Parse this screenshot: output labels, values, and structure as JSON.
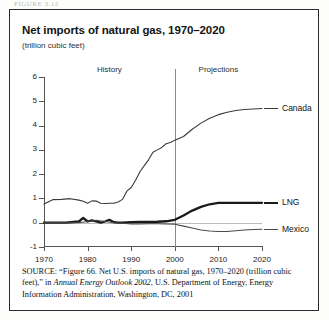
{
  "page": {
    "top_stub_text": "FIGURE 3.12"
  },
  "header": {
    "title": "Net imports of natural gas, 1970–2020",
    "subtitle": "(trillion cubic feet)"
  },
  "source": {
    "label": "SOURCE:",
    "part1": " “Figure 66. Net U.S. imports of natural gas, 1970–2020 (trillion cubic feet),” in ",
    "italic": "Annual Energy Outlook 2002",
    "part2": ", U.S. Department of Energy, Energy Information Administration, Washington, DC, 2001"
  },
  "chart_data": {
    "type": "line",
    "title": "Net imports of natural gas, 1970–2020",
    "subtitle": "(trillion cubic feet)",
    "xlabel": "",
    "ylabel": "(trillion cubic feet)",
    "xlim": [
      1970,
      2020
    ],
    "ylim": [
      -1,
      6
    ],
    "yticks": [
      -1,
      0,
      1,
      2,
      3,
      4,
      5,
      6
    ],
    "xticks": [
      1970,
      1980,
      1990,
      2000,
      2010,
      2020
    ],
    "grid": false,
    "legend_position": "right-inline",
    "annotations": [
      {
        "text": "History",
        "x": 1985,
        "y": 6.3
      },
      {
        "text": "Projections",
        "x": 2010,
        "y": 6.3
      },
      {
        "text": "divider",
        "x": 2000,
        "kind": "vertical-line"
      }
    ],
    "zero_reference_line": 0,
    "series": [
      {
        "name": "Canada",
        "color": "#3a3a3a",
        "width": 1.1,
        "x": [
          1970,
          1972,
          1974,
          1976,
          1978,
          1979,
          1980,
          1981,
          1982,
          1983,
          1984,
          1985,
          1986,
          1987,
          1988,
          1989,
          1990,
          1991,
          1992,
          1993,
          1994,
          1995,
          1996,
          1997,
          1998,
          1999,
          2000,
          2002,
          2004,
          2006,
          2008,
          2010,
          2012,
          2014,
          2016,
          2018,
          2020
        ],
        "y": [
          0.77,
          0.95,
          0.96,
          0.99,
          0.93,
          0.88,
          0.8,
          0.9,
          0.89,
          0.8,
          0.79,
          0.8,
          0.8,
          0.85,
          0.96,
          1.3,
          1.45,
          1.75,
          2.1,
          2.35,
          2.6,
          2.9,
          3.0,
          3.1,
          3.25,
          3.3,
          3.4,
          3.55,
          3.85,
          4.1,
          4.3,
          4.45,
          4.55,
          4.62,
          4.66,
          4.68,
          4.7
        ]
      },
      {
        "name": "LNG",
        "color": "#1a1a1a",
        "width": 2.3,
        "x": [
          1970,
          1975,
          1978,
          1979,
          1980,
          1981,
          1982,
          1983,
          1984,
          1985,
          1986,
          1987,
          1988,
          1990,
          1992,
          1994,
          1996,
          1998,
          2000,
          2002,
          2004,
          2006,
          2008,
          2010,
          2012,
          2014,
          2016,
          2018,
          2020
        ],
        "y": [
          0.0,
          0.0,
          0.05,
          0.2,
          0.05,
          0.1,
          0.05,
          0.0,
          0.05,
          0.12,
          0.02,
          0.0,
          0.0,
          0.02,
          0.03,
          0.03,
          0.04,
          0.06,
          0.12,
          0.3,
          0.5,
          0.65,
          0.76,
          0.82,
          0.82,
          0.82,
          0.82,
          0.82,
          0.82
        ]
      },
      {
        "name": "Mexico",
        "color": "#4a4a4a",
        "width": 1.1,
        "x": [
          1970,
          1975,
          1978,
          1980,
          1982,
          1984,
          1986,
          1988,
          1990,
          1992,
          1994,
          1996,
          1998,
          2000,
          2002,
          2004,
          2006,
          2008,
          2010,
          2012,
          2014,
          2016,
          2018,
          2020
        ],
        "y": [
          0.0,
          0.0,
          0.0,
          0.05,
          0.1,
          0.05,
          0.0,
          -0.02,
          -0.05,
          -0.05,
          -0.04,
          -0.04,
          -0.05,
          -0.06,
          -0.14,
          -0.22,
          -0.3,
          -0.34,
          -0.36,
          -0.36,
          -0.33,
          -0.3,
          -0.28,
          -0.27
        ]
      }
    ]
  }
}
